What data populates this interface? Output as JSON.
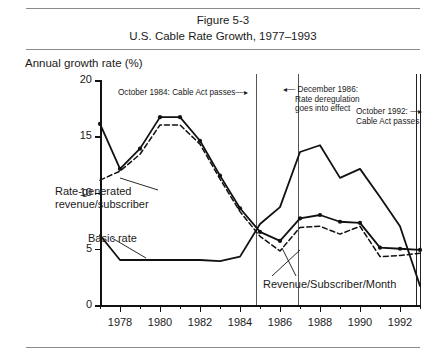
{
  "figure": {
    "title_line1": "Figure 5-3",
    "title_line2": "U.S. Cable Rate Growth, 1977–1993"
  },
  "chart_data": {
    "type": "line",
    "title": "U.S. Cable Rate Growth, 1977–1993",
    "xlabel": "",
    "ylabel": "Annual growth rate (%)",
    "ylim": [
      0,
      20
    ],
    "xlim": [
      1977,
      1993
    ],
    "yticks": [
      0,
      5,
      10,
      15,
      20
    ],
    "ytick_labels": [
      "0",
      "5",
      "10",
      "15",
      "20"
    ],
    "xticks": [
      1978,
      1980,
      1982,
      1984,
      1986,
      1988,
      1990,
      1992
    ],
    "xtick_labels": [
      "1978",
      "1980",
      "1982",
      "1984",
      "1986",
      "1988",
      "1990",
      "1992"
    ],
    "xminor_ticks": [
      1977,
      1979,
      1981,
      1983,
      1985,
      1987,
      1989,
      1991,
      1993
    ],
    "grid": false,
    "legend": "inline-labels",
    "x": [
      1977,
      1978,
      1979,
      1980,
      1981,
      1982,
      1983,
      1984,
      1985,
      1986,
      1987,
      1988,
      1989,
      1990,
      1991,
      1992,
      1993
    ],
    "series": [
      {
        "name": "Rate-generated revenue/subscriber",
        "style": "solid-with-markers",
        "values": [
          16.1,
          12.1,
          13.9,
          16.7,
          16.7,
          14.6,
          11.5,
          8.6,
          6.5,
          5.7,
          7.7,
          8.0,
          7.4,
          7.3,
          5.1,
          5.0,
          4.9
        ]
      },
      {
        "name": "Revenue/Subscriber/Month",
        "style": "dashed",
        "values": [
          11.1,
          11.9,
          13.4,
          16.0,
          16.0,
          14.3,
          11.2,
          8.3,
          6.1,
          4.8,
          6.9,
          7.0,
          6.3,
          7.0,
          4.3,
          4.4,
          4.6
        ]
      },
      {
        "name": "Basic rate",
        "style": "solid",
        "values": [
          6.2,
          4.0,
          4.0,
          4.0,
          4.0,
          4.0,
          3.9,
          4.3,
          7.2,
          8.7,
          13.6,
          14.2,
          11.3,
          12.1,
          9.6,
          7.0,
          1.7
        ]
      }
    ],
    "events": [
      {
        "label_lines": [
          "October 1984: Cable Act passes"
        ],
        "year": 1984.8,
        "arrow": "right"
      },
      {
        "label_lines": [
          "December 1986:",
          "Rate deregulation",
          "goes into effect"
        ],
        "year": 1986.9,
        "arrow": "left"
      },
      {
        "label_lines": [
          "October 1992:",
          "Cable Act passes"
        ],
        "year": 1992.8,
        "arrow": "right"
      }
    ],
    "inline_labels": [
      {
        "lines": [
          "Rate-generated",
          "revenue/subscriber"
        ]
      },
      {
        "lines": [
          "Basic rate"
        ]
      },
      {
        "lines": [
          "Revenue/Subscriber/Month"
        ]
      }
    ]
  },
  "annotations": {
    "event1": "October 1984: Cable Act passes",
    "event2_l1": "December 1986:",
    "event2_l2": "Rate deregulation",
    "event2_l3": "goes into effect",
    "event3_l1": "October 1992: ",
    "event3_l2": "Cable Act passes",
    "label_rgs_l1": "Rate-generated",
    "label_rgs_l2": "revenue/subscriber",
    "label_basic": "Basic rate",
    "label_rsm": "Revenue/Subscriber/Month"
  }
}
